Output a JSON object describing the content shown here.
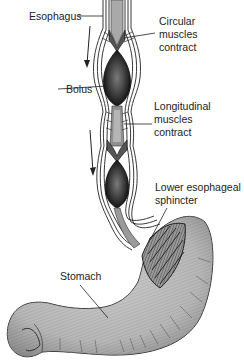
{
  "diagram": {
    "type": "anatomical-illustration",
    "labels": {
      "esophagus": "Esophagus",
      "circular_1": "Circular",
      "circular_2": "muscles",
      "circular_3": "contract",
      "bolus": "Bolus",
      "longitudinal_1": "Longitudinal",
      "longitudinal_2": "muscles",
      "longitudinal_3": "contract",
      "sphincter_1": "Lower esophageal",
      "sphincter_2": "sphincter",
      "stomach": "Stomach"
    },
    "arrows": [
      {
        "direction": "down",
        "position": "upper-left"
      },
      {
        "direction": "down",
        "position": "middle-left"
      }
    ],
    "colors": {
      "ink": "#222222",
      "tissue_light": "#bdbdbd",
      "tissue_mid": "#8a8a8a",
      "bolus_dark": "#2a2a2a",
      "bolus_core": "#6b6b6b",
      "background": "#ffffff"
    }
  }
}
